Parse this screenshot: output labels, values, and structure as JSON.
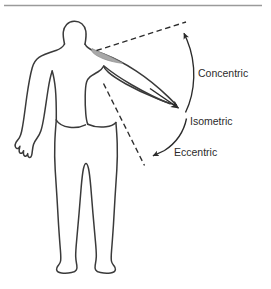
{
  "figure": {
    "background_color": "#ffffff",
    "top_rule_color": "#9a9a9a",
    "outline_color": "#3a3a3a",
    "annotation_color": "#2b2b2b",
    "muscle_fill_color": "#a8a8a8",
    "muscle_name": "deltoid"
  },
  "labels": {
    "concentric": "Concentric",
    "isometric": "Isometric",
    "eccentric": "Eccentric"
  },
  "body": {
    "figure_type": "human-body-silhouette",
    "view": "anterior",
    "right_arm_state": "abducted-raised",
    "left_arm_state": "relaxed-at-side"
  },
  "annotations": {
    "dashed_upper_label": "concentric-end-range-reference",
    "dashed_lower_label": "eccentric-end-range-reference",
    "arc_upper_direction": "upward",
    "arc_lower_direction": "downward",
    "arm_arrow_direction": "distal"
  }
}
